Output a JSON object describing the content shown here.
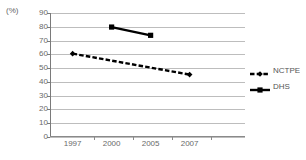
{
  "chart_data": {
    "type": "line",
    "title": "",
    "xlabel": "",
    "ylabel": "",
    "unit_label": "(%)",
    "categories": [
      "1997",
      "2000",
      "2005",
      "2007"
    ],
    "ylim": [
      0,
      90
    ],
    "ytick_step": 10,
    "yticks": [
      "90",
      "80",
      "70",
      "60",
      "50",
      "40",
      "30",
      "20",
      "10",
      "0"
    ],
    "grid": true,
    "legend_position": "right",
    "series": [
      {
        "name": "NCTPE",
        "style": "dashed",
        "marker": "diamond",
        "color": "#000000",
        "points": [
          {
            "x": "1997",
            "y": 60.5
          },
          {
            "x": "2007",
            "y": 45.3
          }
        ]
      },
      {
        "name": "DHS",
        "style": "solid",
        "marker": "square",
        "color": "#000000",
        "points": [
          {
            "x": "2000",
            "y": 79.8
          },
          {
            "x": "2005",
            "y": 73.8
          }
        ]
      }
    ]
  },
  "legend": {
    "items": [
      {
        "label": "NCTPE"
      },
      {
        "label": "DHS"
      }
    ]
  }
}
